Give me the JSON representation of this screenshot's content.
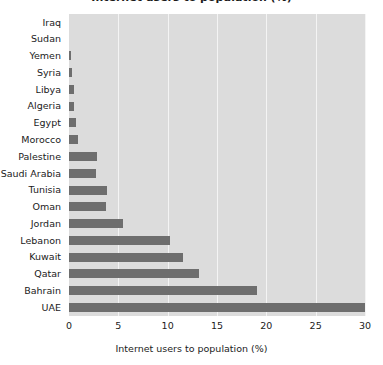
{
  "chart_data": {
    "type": "bar",
    "orientation": "horizontal",
    "title": "Internet users to population (%)",
    "xlabel": "Internet users to population (%)",
    "ylabel": "",
    "xlim": [
      0,
      30
    ],
    "xticks": [
      0,
      5,
      10,
      15,
      20,
      25,
      30
    ],
    "xtick_labels": [
      "0",
      "5",
      "10",
      "15",
      "20",
      "25",
      "30"
    ],
    "grid": true,
    "grid_axis": "x",
    "legend": false,
    "categories": [
      "Iraq",
      "Sudan",
      "Yemen",
      "Syria",
      "Libya",
      "Algeria",
      "Egypt",
      "Morocco",
      "Palestine",
      "Saudi Arabia",
      "Tunisia",
      "Oman",
      "Jordan",
      "Lebanon",
      "Kuwait",
      "Qatar",
      "Bahrain",
      "UAE"
    ],
    "values": [
      0,
      0,
      0.2,
      0.35,
      0.5,
      0.55,
      0.7,
      0.9,
      2.8,
      2.7,
      3.9,
      3.8,
      5.5,
      10.2,
      11.6,
      13.2,
      19.1,
      30.0
    ],
    "colors": {
      "bar": "#6e6e6e",
      "plot_background": "#dcdcdc",
      "gridline": "#f4f4f4",
      "text": "#1b1b1b",
      "page_background": "#ffffff"
    }
  },
  "axis": {
    "x_title": "Internet users to population (%)"
  }
}
